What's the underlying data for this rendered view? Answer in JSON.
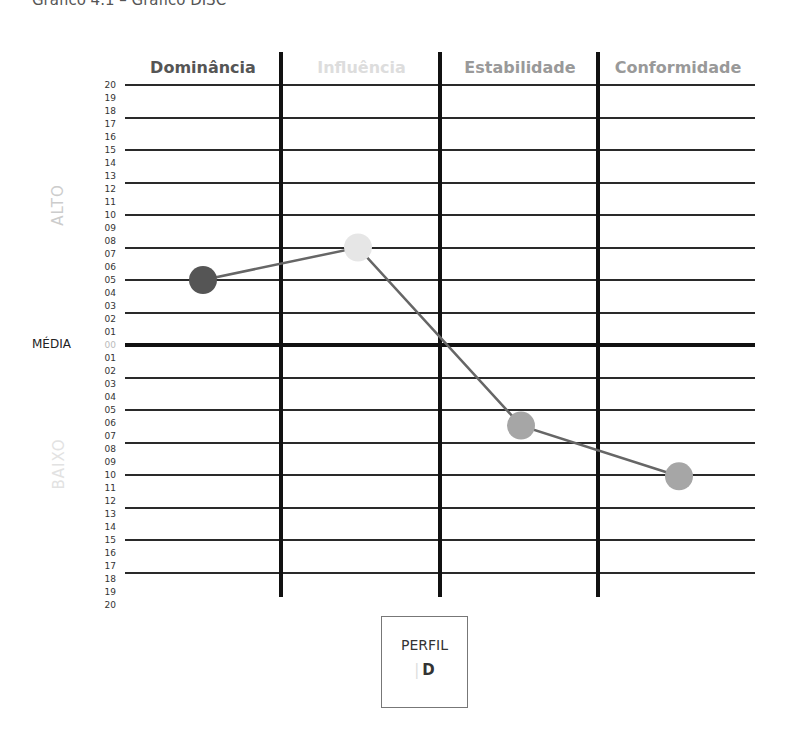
{
  "title": "Gráfico 4.1 – Gráfico DISC",
  "chart_data": {
    "type": "line",
    "title": "Gráfico DISC",
    "categories": [
      "Dominância",
      "Influência",
      "Estabilidade",
      "Conformidade"
    ],
    "values": [
      5,
      7.5,
      -6.2,
      -10.1
    ],
    "point_colors": [
      "#555555",
      "#e6e6e6",
      "#a6a6a6",
      "#a6a6a6"
    ],
    "header_colors": [
      "#555555",
      "#dddddd",
      "#999999",
      "#999999"
    ],
    "y_ticks_high": [
      "20",
      "19",
      "18",
      "17",
      "16",
      "15",
      "14",
      "13",
      "12",
      "11",
      "10",
      "09",
      "08",
      "07",
      "06",
      "05",
      "04",
      "03",
      "02",
      "01"
    ],
    "y_tick_mid": "00",
    "y_ticks_low": [
      "01",
      "02",
      "03",
      "04",
      "05",
      "06",
      "07",
      "08",
      "09",
      "10",
      "11",
      "12",
      "13",
      "14",
      "15",
      "16",
      "17",
      "18",
      "19",
      "20"
    ],
    "ylim": [
      -20,
      20
    ],
    "upper_label": "ALTO",
    "middle_label": "MÉDIA",
    "lower_label": "BAIXO",
    "grid": true,
    "line_color": "#666666"
  },
  "perfil": {
    "label": "PERFIL",
    "value": "D",
    "bar": "|"
  }
}
